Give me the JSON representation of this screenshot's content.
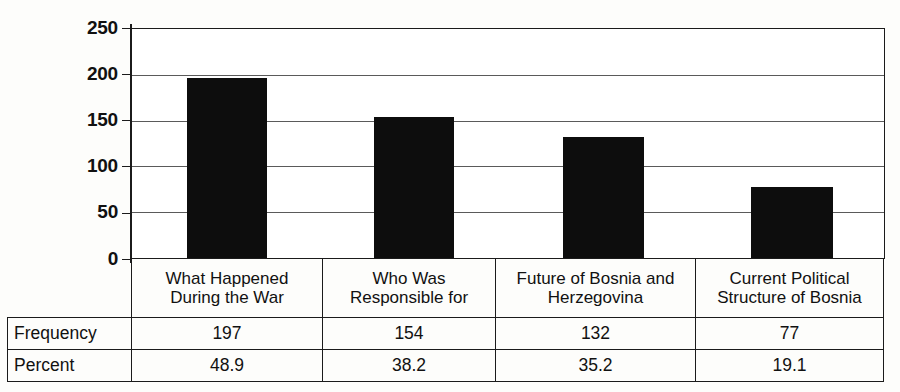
{
  "chart_data": {
    "type": "bar",
    "title": "",
    "subtitle": "",
    "xlabel": "",
    "ylabel": "",
    "categories": [
      "What Happened During the War",
      "Who Was Responsible for",
      "Future of Bosnia and Herzegovina",
      "Current Political Structure of Bosnia"
    ],
    "category_lines": [
      [
        "What Happened",
        "During the War"
      ],
      [
        "Who Was",
        "Responsible for"
      ],
      [
        "Future of Bosnia and",
        "Herzegovina"
      ],
      [
        "Current Political",
        "Structure of Bosnia"
      ]
    ],
    "values": [
      197,
      154,
      132,
      77
    ],
    "series": [
      {
        "name": "Frequency",
        "values": [
          197,
          154,
          132,
          77
        ]
      },
      {
        "name": "Percent",
        "values": [
          48.9,
          38.2,
          35.2,
          19.1
        ]
      }
    ],
    "ylim": [
      0,
      250
    ],
    "yticks": [
      0,
      50,
      100,
      150,
      200,
      250
    ],
    "ytick_labels": [
      "0",
      "50",
      "100",
      "150",
      "200",
      "250"
    ],
    "grid": true,
    "legend": "none",
    "bar_color": "#0d0d0d"
  },
  "table": {
    "row_headers": [
      "Frequency",
      "Percent"
    ],
    "columns": [
      {
        "header_line1": "What Happened",
        "header_line2": "During the War",
        "frequency": "197",
        "percent": "48.9"
      },
      {
        "header_line1": "Who Was",
        "header_line2": "Responsible for",
        "frequency": "154",
        "percent": "38.2"
      },
      {
        "header_line1": "Future of Bosnia and",
        "header_line2": "Herzegovina",
        "frequency": "132",
        "percent": "35.2"
      },
      {
        "header_line1": "Current Political",
        "header_line2": "Structure of Bosnia",
        "frequency": "77",
        "percent": "19.1"
      }
    ]
  },
  "axis": {
    "t250": "250",
    "t200": "200",
    "t150": "150",
    "t100": "100",
    "t50": "50",
    "t0": "0"
  }
}
